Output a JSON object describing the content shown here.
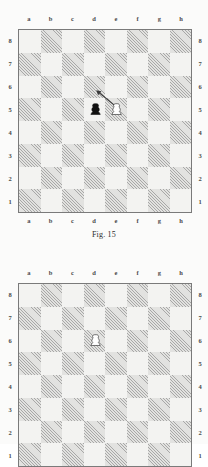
{
  "page": {
    "background_color": "#fbfbfa",
    "width": 208,
    "height": 444
  },
  "style": {
    "light_square_color": "#f3f3f1",
    "dark_square_color": "#e2e2e0",
    "border_color": "#7a7a7a",
    "label_color": "#4a4a4a",
    "black_piece_color": "#111111",
    "white_piece_fill": "#ffffff",
    "white_piece_stroke": "#1a1a1a",
    "arrow_color": "#3a3a3a"
  },
  "figures": [
    {
      "id": "figure-1",
      "caption": "Fig. 15",
      "files": [
        "a",
        "b",
        "c",
        "d",
        "e",
        "f",
        "g",
        "h"
      ],
      "ranks": [
        "8",
        "7",
        "6",
        "5",
        "4",
        "3",
        "2",
        "1"
      ],
      "orientation": "white-bottom",
      "pieces": [
        {
          "square": "d5",
          "piece": "pawn",
          "color": "black",
          "label": "black-pawn-d5"
        },
        {
          "square": "e5",
          "piece": "pawn",
          "color": "white",
          "label": "white-pawn-e5"
        }
      ],
      "arrows": [
        {
          "from": "e5",
          "to": "d6",
          "label": "move-arrow-e5-d6"
        }
      ]
    },
    {
      "id": "figure-2",
      "caption": "",
      "files": [
        "a",
        "b",
        "c",
        "d",
        "e",
        "f",
        "g",
        "h"
      ],
      "ranks": [
        "8",
        "7",
        "6",
        "5",
        "4",
        "3",
        "2",
        "1"
      ],
      "orientation": "white-bottom",
      "cropped": true,
      "pieces": [
        {
          "square": "d6",
          "piece": "pawn",
          "color": "white",
          "label": "white-pawn-d6"
        }
      ],
      "arrows": []
    }
  ]
}
